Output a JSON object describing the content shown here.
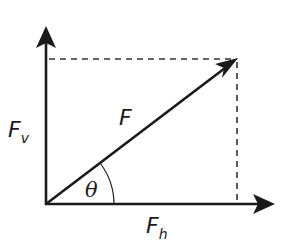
{
  "diagram": {
    "colors": {
      "stroke": "#1a1a1a",
      "dashed": "#333333",
      "background": "#ffffff"
    },
    "origin": {
      "x": 46,
      "y": 204
    },
    "axes": {
      "vertical_tip": {
        "x": 46,
        "y": 26
      },
      "horizontal_tip": {
        "x": 274,
        "y": 204
      }
    },
    "vector": {
      "tip": {
        "x": 237,
        "y": 59
      }
    },
    "labels": {
      "force": "F",
      "vertical_component_main": "F",
      "vertical_component_sub": "v",
      "horizontal_component_main": "F",
      "horizontal_component_sub": "h",
      "angle": "θ"
    }
  }
}
